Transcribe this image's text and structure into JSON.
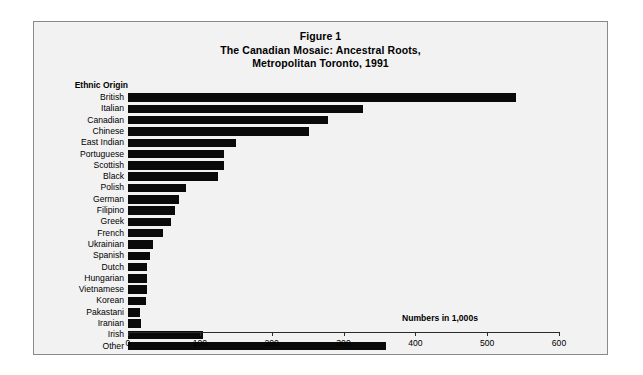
{
  "figure": {
    "title_lines": [
      "Figure 1",
      "The Canadian Mosaic: Ancestral Roots,",
      "Metropolitan Toronto, 1991"
    ],
    "title_line_1": "Figure 1",
    "title_line_2": "The Canadian Mosaic: Ancestral Roots,",
    "title_line_3": "Metropolitan Toronto, 1991",
    "category_axis_heading": "Ethnic Origin",
    "units_note": "Numbers in 1,000s"
  },
  "chart_data": {
    "type": "bar",
    "orientation": "horizontal",
    "title": "Figure 1\nThe Canadian Mosaic: Ancestral Roots, Metropolitan Toronto, 1991",
    "subtitle": "Metropolitan Toronto, 1991",
    "xlabel": "Numbers in 1,000s",
    "ylabel": "Ethnic Origin",
    "xlim": [
      0,
      600
    ],
    "xticks": [
      0,
      100,
      200,
      300,
      400,
      500,
      600
    ],
    "xtick_labels": [
      "0",
      "100",
      "200",
      "300",
      "400",
      "500",
      "600"
    ],
    "grid": false,
    "legend": false,
    "bar_color": "#0a0a0a",
    "background_color": "#f2f2f2",
    "categories": [
      "British",
      "Italian",
      "Canadian",
      "Chinese",
      "East Indian",
      "Portuguese",
      "Scottish",
      "Black",
      "Polish",
      "German",
      "Filipino",
      "Greek",
      "French",
      "Ukrainian",
      "Spanish",
      "Dutch",
      "Hungarian",
      "Vietnamese",
      "Korean",
      "Pakastani",
      "Iranian",
      "Irish",
      "Other"
    ],
    "values": [
      540,
      327,
      279,
      252,
      150,
      134,
      134,
      125,
      81,
      71,
      66,
      60,
      49,
      35,
      31,
      27,
      27,
      27,
      25,
      17,
      18,
      105,
      359
    ],
    "series": [
      {
        "name": "Population",
        "values": [
          540,
          327,
          279,
          252,
          150,
          134,
          134,
          125,
          81,
          71,
          66,
          60,
          49,
          35,
          31,
          27,
          27,
          27,
          25,
          17,
          18,
          105,
          359
        ]
      }
    ]
  }
}
